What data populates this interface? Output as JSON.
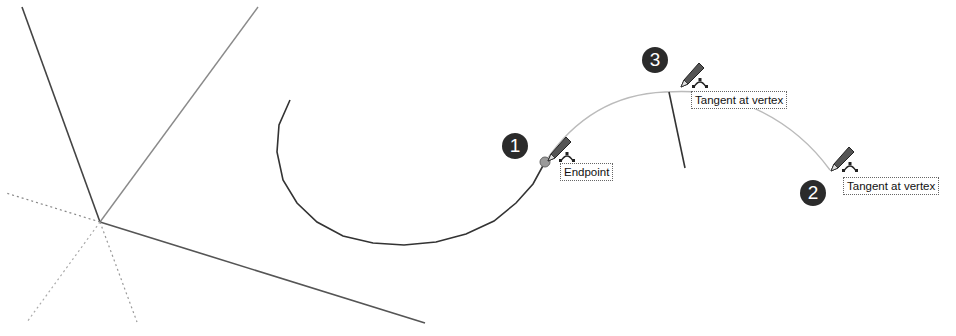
{
  "scene": {
    "description": "SketchUp-style arc tool inference sequence",
    "colors": {
      "background": "#ffffff",
      "axis_dark": "#444444",
      "axis_gray": "#888888",
      "arc_dark": "#333333",
      "arc_preview": "#bbbbbb",
      "badge": "#2b2b2b",
      "endpoint_dot": "#999999"
    }
  },
  "steps": [
    {
      "number": "1",
      "tooltip": "Endpoint",
      "cursor_icon": "pencil-arc-icon"
    },
    {
      "number": "2",
      "tooltip": "Tangent at vertex",
      "cursor_icon": "pencil-arc-icon"
    },
    {
      "number": "3",
      "tooltip": "Tangent at vertex",
      "cursor_icon": "pencil-arc-icon"
    }
  ]
}
